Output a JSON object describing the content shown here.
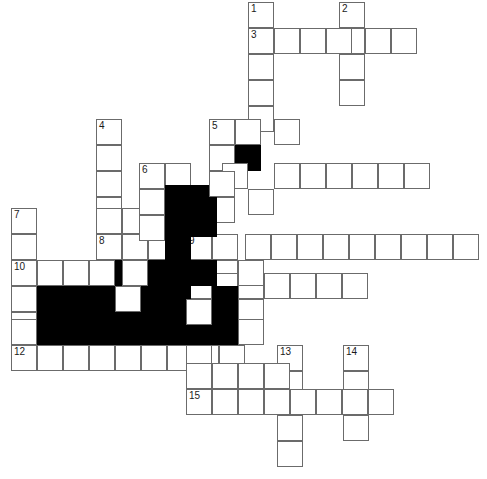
{
  "puzzle": {
    "title": "Crossword Grid",
    "cell_size": 26,
    "grid_origin": {
      "x": 11,
      "y": 2
    },
    "colors": {
      "cell_fill": "#ffffff",
      "cell_border": "#6b6b6b",
      "block_fill": "#000000",
      "number_color": "#1a1a1a"
    },
    "entries": [
      {
        "number": 1,
        "direction": "down",
        "length": 5,
        "col": 9,
        "row": 0
      },
      {
        "number": 2,
        "direction": "down",
        "length": 4,
        "col": 13,
        "row": 0
      },
      {
        "number": 3,
        "direction": "across",
        "length": 7,
        "col": 9,
        "row": 1
      },
      {
        "number": 4,
        "direction": "down",
        "length": 6,
        "col": 3,
        "row": 4.5
      },
      {
        "number": 5,
        "direction": "across",
        "length": 4,
        "col": 7.65,
        "row": 4.5
      },
      {
        "number": 6,
        "direction": "across",
        "length": 11,
        "col": 5,
        "row": 6.2
      },
      {
        "number": 7,
        "direction": "down",
        "length": 6,
        "col": 0,
        "row": 7.9
      },
      {
        "number": 8,
        "direction": "across",
        "length": 14,
        "col": 3,
        "row": 9.05
      },
      {
        "number": 9,
        "direction": "down",
        "length": 1,
        "col": 7,
        "row": 9.05
      },
      {
        "number": 10,
        "direction": "across",
        "length": 9,
        "col": 0,
        "row": 10.1
      },
      {
        "number": 11,
        "direction": "across",
        "length": 7,
        "col": 6.7,
        "row": 10.6
      },
      {
        "number": 12,
        "direction": "across",
        "length": 9,
        "col": 0,
        "row": 13.2
      },
      {
        "number": 13,
        "direction": "down",
        "length": 5,
        "col": 10.2,
        "row": 13.2
      },
      {
        "number": 14,
        "direction": "down",
        "length": 4,
        "col": 12.8,
        "row": 13.2
      },
      {
        "number": 15,
        "direction": "across",
        "length": 8,
        "col": 6.7,
        "row": 14.9
      }
    ],
    "cells": [
      {
        "name": "c-1-d-0",
        "x": 248,
        "y": 2,
        "block": false,
        "number": "1"
      },
      {
        "name": "c-1-d-1",
        "x": 248,
        "y": 28,
        "block": false,
        "number": "3"
      },
      {
        "name": "c-1-d-2",
        "x": 248,
        "y": 54,
        "block": false,
        "number": ""
      },
      {
        "name": "c-1-d-3",
        "x": 248,
        "y": 80,
        "block": false,
        "number": ""
      },
      {
        "name": "c-1-d-4",
        "x": 248,
        "y": 106,
        "block": false,
        "number": ""
      },
      {
        "name": "c-2-d-0",
        "x": 339,
        "y": 2,
        "block": false,
        "number": "2"
      },
      {
        "name": "c-2-d-1",
        "x": 339,
        "y": 28,
        "block": false,
        "number": ""
      },
      {
        "name": "c-2-d-2",
        "x": 339,
        "y": 54,
        "block": false,
        "number": ""
      },
      {
        "name": "c-2-d-3",
        "x": 339,
        "y": 80,
        "block": false,
        "number": ""
      },
      {
        "name": "c-3-a-1",
        "x": 274,
        "y": 28,
        "block": false,
        "number": ""
      },
      {
        "name": "c-3-a-2",
        "x": 300,
        "y": 28,
        "block": false,
        "number": ""
      },
      {
        "name": "c-3-a-3",
        "x": 326,
        "y": 28,
        "block": false,
        "number": ""
      },
      {
        "name": "c-3-a-5",
        "x": 365,
        "y": 28,
        "block": false,
        "number": ""
      },
      {
        "name": "c-3-a-6",
        "x": 391,
        "y": 28,
        "block": false,
        "number": ""
      },
      {
        "name": "c-4-d-0",
        "x": 96,
        "y": 119,
        "block": false,
        "number": "4"
      },
      {
        "name": "c-4-d-1",
        "x": 96,
        "y": 145,
        "block": false,
        "number": ""
      },
      {
        "name": "c-4-d-2",
        "x": 96,
        "y": 171,
        "block": false,
        "number": ""
      },
      {
        "name": "c-4-d-3",
        "x": 96,
        "y": 197,
        "block": false,
        "number": ""
      },
      {
        "name": "c-4-d-4",
        "x": 96,
        "y": 223,
        "block": false,
        "number": ""
      },
      {
        "name": "c-5-a-0",
        "x": 209,
        "y": 119,
        "block": false,
        "number": "5"
      },
      {
        "name": "c-5-a-1",
        "x": 235,
        "y": 119,
        "block": false,
        "number": ""
      },
      {
        "name": "c-5-a-3",
        "x": 274,
        "y": 119,
        "block": false,
        "number": ""
      },
      {
        "name": "c-5-blk",
        "x": 235,
        "y": 145,
        "block": true,
        "number": ""
      },
      {
        "name": "c-5-d-1",
        "x": 209,
        "y": 145,
        "block": false,
        "number": ""
      },
      {
        "name": "c-5-d-2",
        "x": 209,
        "y": 197,
        "block": false,
        "number": ""
      },
      {
        "name": "c-6-a-0",
        "x": 139,
        "y": 163,
        "block": false,
        "number": "6"
      },
      {
        "name": "c-6-a-1",
        "x": 165,
        "y": 163,
        "block": false,
        "number": ""
      },
      {
        "name": "c-6-a-3",
        "x": 222,
        "y": 163,
        "block": false,
        "number": ""
      },
      {
        "name": "c-6-a-5",
        "x": 274,
        "y": 163,
        "block": false,
        "number": ""
      },
      {
        "name": "c-6-a-6",
        "x": 300,
        "y": 163,
        "block": false,
        "number": ""
      },
      {
        "name": "c-6-a-7",
        "x": 326,
        "y": 163,
        "block": false,
        "number": ""
      },
      {
        "name": "c-6-a-8",
        "x": 352,
        "y": 163,
        "block": false,
        "number": ""
      },
      {
        "name": "c-6-a-9",
        "x": 378,
        "y": 163,
        "block": false,
        "number": ""
      },
      {
        "name": "c-6-a-10",
        "x": 404,
        "y": 163,
        "block": false,
        "number": ""
      },
      {
        "name": "c-7-d-0",
        "x": 11,
        "y": 208,
        "block": false,
        "number": "7"
      },
      {
        "name": "c-7-d-1",
        "x": 11,
        "y": 234,
        "block": false,
        "number": ""
      },
      {
        "name": "c-7-d-2",
        "x": 11,
        "y": 260,
        "block": false,
        "number": "10"
      },
      {
        "name": "c-7-d-3",
        "x": 11,
        "y": 286,
        "block": false,
        "number": ""
      },
      {
        "name": "c-7-d-4",
        "x": 11,
        "y": 312,
        "block": false,
        "number": ""
      },
      {
        "name": "c-8-a-0",
        "x": 96,
        "y": 234,
        "block": false,
        "number": "8"
      },
      {
        "name": "c-8-a-1",
        "x": 122,
        "y": 234,
        "block": false,
        "number": ""
      },
      {
        "name": "c-8-a-2",
        "x": 148,
        "y": 234,
        "block": false,
        "number": ""
      },
      {
        "name": "c-9-a-0",
        "x": 186,
        "y": 234,
        "block": false,
        "number": "9"
      },
      {
        "name": "c-8-a-5",
        "x": 212,
        "y": 234,
        "block": false,
        "number": ""
      },
      {
        "name": "c-8-a-6",
        "x": 245,
        "y": 234,
        "block": false,
        "number": ""
      },
      {
        "name": "c-8-a-7",
        "x": 271,
        "y": 234,
        "block": false,
        "number": ""
      },
      {
        "name": "c-8-a-8",
        "x": 297,
        "y": 234,
        "block": false,
        "number": ""
      },
      {
        "name": "c-8-a-9",
        "x": 323,
        "y": 234,
        "block": false,
        "number": ""
      },
      {
        "name": "c-8-a-10",
        "x": 349,
        "y": 234,
        "block": false,
        "number": ""
      },
      {
        "name": "c-8-a-11",
        "x": 375,
        "y": 234,
        "block": false,
        "number": ""
      },
      {
        "name": "c-8-a-12",
        "x": 401,
        "y": 234,
        "block": false,
        "number": ""
      },
      {
        "name": "c-8-a-13",
        "x": 427,
        "y": 234,
        "block": false,
        "number": ""
      },
      {
        "name": "c-8-a-14",
        "x": 453,
        "y": 234,
        "block": false,
        "number": ""
      },
      {
        "name": "c-10-a-1",
        "x": 37,
        "y": 260,
        "block": false,
        "number": ""
      },
      {
        "name": "c-10-a-2",
        "x": 63,
        "y": 260,
        "block": false,
        "number": ""
      },
      {
        "name": "c-10-a-3",
        "x": 89,
        "y": 260,
        "block": false,
        "number": ""
      },
      {
        "name": "c-10-a-4",
        "x": 115,
        "y": 260,
        "block": false,
        "number": ""
      },
      {
        "name": "c-10-a-6",
        "x": 160,
        "y": 260,
        "block": false,
        "number": ""
      },
      {
        "name": "c-10-a-8",
        "x": 212,
        "y": 260,
        "block": false,
        "number": ""
      },
      {
        "name": "c-11-a-0",
        "x": 186,
        "y": 273,
        "block": false,
        "number": "11"
      },
      {
        "name": "c-11-a-1",
        "x": 212,
        "y": 273,
        "block": false,
        "number": ""
      },
      {
        "name": "c-11-a-2",
        "x": 238,
        "y": 273,
        "block": false,
        "number": ""
      },
      {
        "name": "c-11-a-3",
        "x": 264,
        "y": 273,
        "block": false,
        "number": ""
      },
      {
        "name": "c-11-a-4",
        "x": 290,
        "y": 273,
        "block": false,
        "number": ""
      },
      {
        "name": "c-11-a-5",
        "x": 316,
        "y": 273,
        "block": false,
        "number": ""
      },
      {
        "name": "c-11-a-6",
        "x": 342,
        "y": 273,
        "block": false,
        "number": ""
      },
      {
        "name": "c-12-a-0",
        "x": 11,
        "y": 345,
        "block": false,
        "number": "12"
      },
      {
        "name": "c-12-a-1",
        "x": 37,
        "y": 345,
        "block": false,
        "number": ""
      },
      {
        "name": "c-12-a-2",
        "x": 63,
        "y": 345,
        "block": false,
        "number": ""
      },
      {
        "name": "c-12-a-3",
        "x": 89,
        "y": 345,
        "block": false,
        "number": ""
      },
      {
        "name": "c-12-a-4",
        "x": 115,
        "y": 345,
        "block": false,
        "number": ""
      },
      {
        "name": "c-12-a-5",
        "x": 141,
        "y": 345,
        "block": false,
        "number": ""
      },
      {
        "name": "c-12-a-6",
        "x": 167,
        "y": 345,
        "block": false,
        "number": ""
      },
      {
        "name": "c-12-a-7",
        "x": 193,
        "y": 345,
        "block": false,
        "number": ""
      },
      {
        "name": "c-12-a-8",
        "x": 219,
        "y": 345,
        "block": false,
        "number": ""
      },
      {
        "name": "c-13-d-0",
        "x": 277,
        "y": 345,
        "block": false,
        "number": "13"
      },
      {
        "name": "c-13-d-1",
        "x": 277,
        "y": 371,
        "block": false,
        "number": ""
      },
      {
        "name": "c-13-d-3",
        "x": 277,
        "y": 415,
        "block": false,
        "number": ""
      },
      {
        "name": "c-13-d-4",
        "x": 277,
        "y": 441,
        "block": false,
        "number": ""
      },
      {
        "name": "c-14-d-0",
        "x": 343,
        "y": 345,
        "block": false,
        "number": "14"
      },
      {
        "name": "c-14-d-1",
        "x": 343,
        "y": 371,
        "block": false,
        "number": ""
      },
      {
        "name": "c-14-d-3",
        "x": 343,
        "y": 415,
        "block": false,
        "number": ""
      },
      {
        "name": "c-15-a-0",
        "x": 186,
        "y": 389,
        "block": false,
        "number": "15"
      },
      {
        "name": "c-15-a-1",
        "x": 212,
        "y": 389,
        "block": false,
        "number": ""
      },
      {
        "name": "c-15-a-2",
        "x": 238,
        "y": 389,
        "block": false,
        "number": ""
      },
      {
        "name": "c-15-a-3",
        "x": 264,
        "y": 389,
        "block": false,
        "number": ""
      },
      {
        "name": "c-15-a-4",
        "x": 290,
        "y": 389,
        "block": false,
        "number": ""
      },
      {
        "name": "c-15-a-5",
        "x": 316,
        "y": 389,
        "block": false,
        "number": ""
      },
      {
        "name": "c-15-a-6",
        "x": 342,
        "y": 389,
        "block": false,
        "number": ""
      },
      {
        "name": "c-15-a-7",
        "x": 368,
        "y": 389,
        "block": false,
        "number": ""
      },
      {
        "name": "blk-mid-0",
        "x": 165,
        "y": 185,
        "block": true,
        "number": ""
      },
      {
        "name": "blk-mid-1",
        "x": 191,
        "y": 185,
        "block": true,
        "number": ""
      },
      {
        "name": "blk-mid-2",
        "x": 165,
        "y": 211,
        "block": true,
        "number": ""
      },
      {
        "name": "blk-mid-3",
        "x": 191,
        "y": 211,
        "block": true,
        "number": ""
      },
      {
        "name": "blk-mid-4",
        "x": 165,
        "y": 234,
        "block": true,
        "number": ""
      },
      {
        "name": "blk-mid-5",
        "x": 165,
        "y": 260,
        "block": true,
        "number": ""
      },
      {
        "name": "blk-mid-6",
        "x": 191,
        "y": 260,
        "block": true,
        "number": ""
      },
      {
        "name": "blk-mid-7",
        "x": 165,
        "y": 286,
        "block": true,
        "number": ""
      },
      {
        "name": "blk-mid-8",
        "x": 165,
        "y": 299,
        "block": true,
        "number": ""
      },
      {
        "name": "blk-mid-9",
        "x": 191,
        "y": 299,
        "block": true,
        "number": ""
      },
      {
        "name": "blk-mid-10",
        "x": 165,
        "y": 319,
        "block": true,
        "number": ""
      },
      {
        "name": "blk-mid-11",
        "x": 191,
        "y": 319,
        "block": true,
        "number": ""
      },
      {
        "name": "blk-l-0",
        "x": 37,
        "y": 286,
        "block": true,
        "number": ""
      },
      {
        "name": "blk-l-1",
        "x": 63,
        "y": 286,
        "block": true,
        "number": ""
      },
      {
        "name": "blk-l-2",
        "x": 89,
        "y": 286,
        "block": true,
        "number": ""
      },
      {
        "name": "blk-l-3",
        "x": 141,
        "y": 286,
        "block": true,
        "number": ""
      },
      {
        "name": "blk-l-4",
        "x": 37,
        "y": 312,
        "block": true,
        "number": ""
      },
      {
        "name": "blk-l-5",
        "x": 63,
        "y": 312,
        "block": true,
        "number": ""
      },
      {
        "name": "blk-l-6",
        "x": 89,
        "y": 312,
        "block": true,
        "number": ""
      },
      {
        "name": "blk-l-7",
        "x": 115,
        "y": 312,
        "block": true,
        "number": ""
      },
      {
        "name": "blk-l-8",
        "x": 141,
        "y": 312,
        "block": true,
        "number": ""
      },
      {
        "name": "blk-l-9",
        "x": 37,
        "y": 319,
        "block": true,
        "number": ""
      },
      {
        "name": "blk-l-10",
        "x": 63,
        "y": 319,
        "block": true,
        "number": ""
      },
      {
        "name": "blk-l-11",
        "x": 89,
        "y": 319,
        "block": true,
        "number": ""
      },
      {
        "name": "blk-l-12",
        "x": 115,
        "y": 319,
        "block": true,
        "number": ""
      },
      {
        "name": "blk-l-13",
        "x": 141,
        "y": 319,
        "block": true,
        "number": ""
      },
      {
        "name": "blk-l-14",
        "x": 115,
        "y": 260,
        "block": true,
        "number": ""
      },
      {
        "name": "blk-l-15",
        "x": 141,
        "y": 260,
        "block": true,
        "number": ""
      },
      {
        "name": "blk-l-16",
        "x": 115,
        "y": 286,
        "block": false,
        "number": ""
      },
      {
        "name": "blk-r-0",
        "x": 212,
        "y": 286,
        "block": true,
        "number": ""
      },
      {
        "name": "blk-r-1",
        "x": 212,
        "y": 312,
        "block": true,
        "number": ""
      },
      {
        "name": "blk-r-2",
        "x": 212,
        "y": 319,
        "block": true,
        "number": ""
      },
      {
        "name": "blk-r-3",
        "x": 186,
        "y": 319,
        "block": true,
        "number": ""
      },
      {
        "name": "extra-0",
        "x": 186,
        "y": 299,
        "block": false,
        "number": ""
      },
      {
        "name": "extra-1",
        "x": 238,
        "y": 299,
        "block": false,
        "number": ""
      },
      {
        "name": "extra-2",
        "x": 238,
        "y": 319,
        "block": false,
        "number": ""
      },
      {
        "name": "extra-3",
        "x": 238,
        "y": 260,
        "block": false,
        "number": ""
      },
      {
        "name": "extra-4",
        "x": 11,
        "y": 286,
        "block": false,
        "number": ""
      },
      {
        "name": "extra-5",
        "x": 11,
        "y": 319,
        "block": false,
        "number": ""
      },
      {
        "name": "extra-6",
        "x": 122,
        "y": 260,
        "block": false,
        "number": ""
      },
      {
        "name": "extra-7",
        "x": 122,
        "y": 208,
        "block": false,
        "number": ""
      },
      {
        "name": "extra-8",
        "x": 96,
        "y": 208,
        "block": false,
        "number": ""
      },
      {
        "name": "extra-9",
        "x": 139,
        "y": 189,
        "block": false,
        "number": ""
      },
      {
        "name": "extra-10",
        "x": 139,
        "y": 215,
        "block": false,
        "number": ""
      },
      {
        "name": "extra-11",
        "x": 248,
        "y": 189,
        "block": false,
        "number": ""
      },
      {
        "name": "extra-12",
        "x": 209,
        "y": 171,
        "block": false,
        "number": ""
      },
      {
        "name": "extra-13",
        "x": 186,
        "y": 345,
        "block": false,
        "number": ""
      },
      {
        "name": "extra-14",
        "x": 212,
        "y": 363,
        "block": false,
        "number": ""
      },
      {
        "name": "extra-15",
        "x": 238,
        "y": 363,
        "block": false,
        "number": ""
      },
      {
        "name": "extra-16",
        "x": 186,
        "y": 363,
        "block": false,
        "number": ""
      },
      {
        "name": "extra-17",
        "x": 264,
        "y": 363,
        "block": false,
        "number": ""
      }
    ]
  }
}
